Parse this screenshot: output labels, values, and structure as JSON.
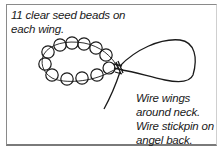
{
  "diagram": {
    "type": "craft-instruction-illustration",
    "bead_count_per_wing": 11,
    "colors": {
      "line": "#1a1a1a",
      "frame": "#8a8a8a",
      "background": "#ffffff"
    }
  },
  "captions": {
    "top": {
      "lines": [
        "11 clear seed beads on",
        "each wing."
      ]
    },
    "bottom": {
      "lines": [
        "Wire wings",
        "around neck.",
        "Wire stickpin on",
        "angel back."
      ]
    }
  },
  "icons": {
    "bead_loop": "bead-loop-icon",
    "wire_loop": "wire-loop-icon",
    "wire_twist": "wire-twist-icon"
  }
}
